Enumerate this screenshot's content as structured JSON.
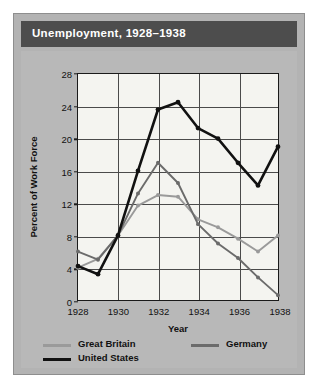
{
  "figure": {
    "title": "Unemployment, 1928–1938",
    "title_bar_color": "#4d4d4d",
    "panel_color": "#b8b8b8",
    "plot_background": "#f4f4f0",
    "frame_color": "#1a1a1a"
  },
  "axes": {
    "ylabel": "Percent of Work Force",
    "xlabel": "Year",
    "yticks": [
      0,
      4,
      8,
      12,
      16,
      20,
      24,
      28
    ],
    "xticks": [
      1928,
      1930,
      1932,
      1934,
      1936,
      1938
    ],
    "ylim": [
      0,
      28
    ],
    "xlim": [
      1928,
      1938
    ],
    "grid": "both"
  },
  "legend": {
    "position": "below-axes",
    "entries": [
      {
        "key": "great_britain",
        "label": "Great Britain",
        "color": "#9a9a9a"
      },
      {
        "key": "germany",
        "label": "Germany",
        "color": "#6b6b6b"
      },
      {
        "key": "united_states",
        "label": "United States",
        "color": "#111111"
      }
    ]
  },
  "chart_data": {
    "type": "line",
    "title": "Unemployment, 1928–1938",
    "xlabel": "Year",
    "ylabel": "Percent of Work Force",
    "xlim": [
      1928,
      1938
    ],
    "ylim": [
      0,
      28
    ],
    "grid": true,
    "legend_position": "below",
    "x": [
      1928,
      1929,
      1930,
      1931,
      1932,
      1933,
      1934,
      1935,
      1936,
      1937,
      1938
    ],
    "series": [
      {
        "name": "United States",
        "color": "#111111",
        "values": [
          4.2,
          3.2,
          8.7,
          15.9,
          23.6,
          24.9,
          21.7,
          20.1,
          16.9,
          14.3,
          19.0
        ]
      },
      {
        "name": "Germany",
        "color": "#6b6b6b",
        "values": [
          6.3,
          9.3,
          15.3,
          23.3,
          30.1,
          26.3,
          14.9,
          11.6,
          8.3,
          4.6,
          2.1
        ]
      },
      {
        "name": "Great Britain",
        "color": "#9a9a9a",
        "values": [
          10.8,
          10.4,
          16.1,
          21.3,
          22.1,
          19.9,
          16.7,
          15.5,
          13.1,
          10.8,
          12.9
        ]
      }
    ],
    "plotted_series": [
      {
        "name": "United States",
        "color": "#111111",
        "values": [
          4.2,
          3.2,
          8.0,
          16.0,
          23.6,
          24.5,
          21.3,
          20.0,
          17.0,
          14.2,
          19.0
        ]
      },
      {
        "name": "Germany",
        "color": "#6b6b6b",
        "values": [
          6.0,
          5.0,
          8.0,
          13.2,
          17.0,
          14.5,
          9.4,
          7.0,
          5.2,
          2.8,
          0.6
        ]
      },
      {
        "name": "Great Britain",
        "color": "#9a9a9a",
        "values": [
          4.0,
          5.1,
          8.0,
          11.7,
          13.0,
          12.8,
          10.0,
          9.0,
          7.6,
          6.0,
          8.0
        ]
      }
    ]
  }
}
